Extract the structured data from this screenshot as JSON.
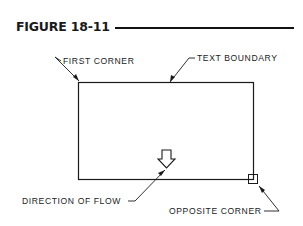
{
  "figure": {
    "title": "FIGURE 18-11"
  },
  "labels": {
    "first_corner": "FIRST CORNER",
    "text_boundary": "TEXT BOUNDARY",
    "direction_of_flow": "DIRECTION OF FLOW",
    "opposite_corner": "OPPOSITE CORNER"
  },
  "colors": {
    "line": "#1a1a1a",
    "background": "#ffffff"
  }
}
